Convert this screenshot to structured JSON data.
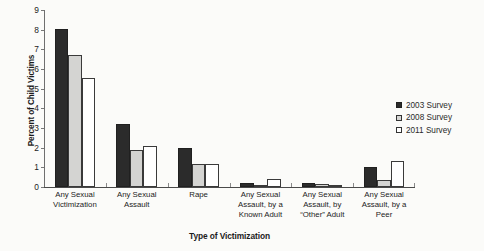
{
  "chart_data": {
    "type": "bar",
    "title": "",
    "xlabel": "Type of Victimization",
    "ylabel": "Percent of Child Victims",
    "ylim": [
      0,
      9
    ],
    "yticks": [
      0,
      1,
      2,
      3,
      4,
      5,
      6,
      7,
      8,
      9
    ],
    "grid": false,
    "legend_position": "right",
    "categories": [
      "Any Sexual Victimization",
      "Any Sexual Assault",
      "Rape",
      "Any Sexual Assault, by a Known Adult",
      "Any Sexual Assault, by “Other” Adult",
      "Any Sexual Assault, by a Peer"
    ],
    "category_lines": [
      [
        "Any Sexual",
        "Victimization"
      ],
      [
        "Any Sexual",
        "Assault"
      ],
      [
        "Rape"
      ],
      [
        "Any Sexual",
        "Assault, by a",
        "Known Adult"
      ],
      [
        "Any Sexual",
        "Assault, by",
        "“Other” Adult"
      ],
      [
        "Any Sexual",
        "Assault, by a",
        "Peer"
      ]
    ],
    "series": [
      {
        "name": "2003 Survey",
        "color": "#2b2b2b",
        "values": [
          8.05,
          3.2,
          2.0,
          0.2,
          0.2,
          1.0
        ]
      },
      {
        "name": "2008 Survey",
        "color": "#d4d4d2",
        "values": [
          6.7,
          1.9,
          1.15,
          0.1,
          0.15,
          0.35
        ]
      },
      {
        "name": "2011 Survey",
        "color": "#ffffff",
        "values": [
          5.55,
          2.1,
          1.15,
          0.4,
          0.1,
          1.3
        ]
      }
    ]
  },
  "legend": {
    "items": [
      {
        "label": "2003 Survey",
        "swatch": "filled-black-square-icon"
      },
      {
        "label": "2008 Survey",
        "swatch": "filled-gray-square-icon"
      },
      {
        "label": "2011 Survey",
        "swatch": "outline-white-square-icon"
      }
    ]
  }
}
